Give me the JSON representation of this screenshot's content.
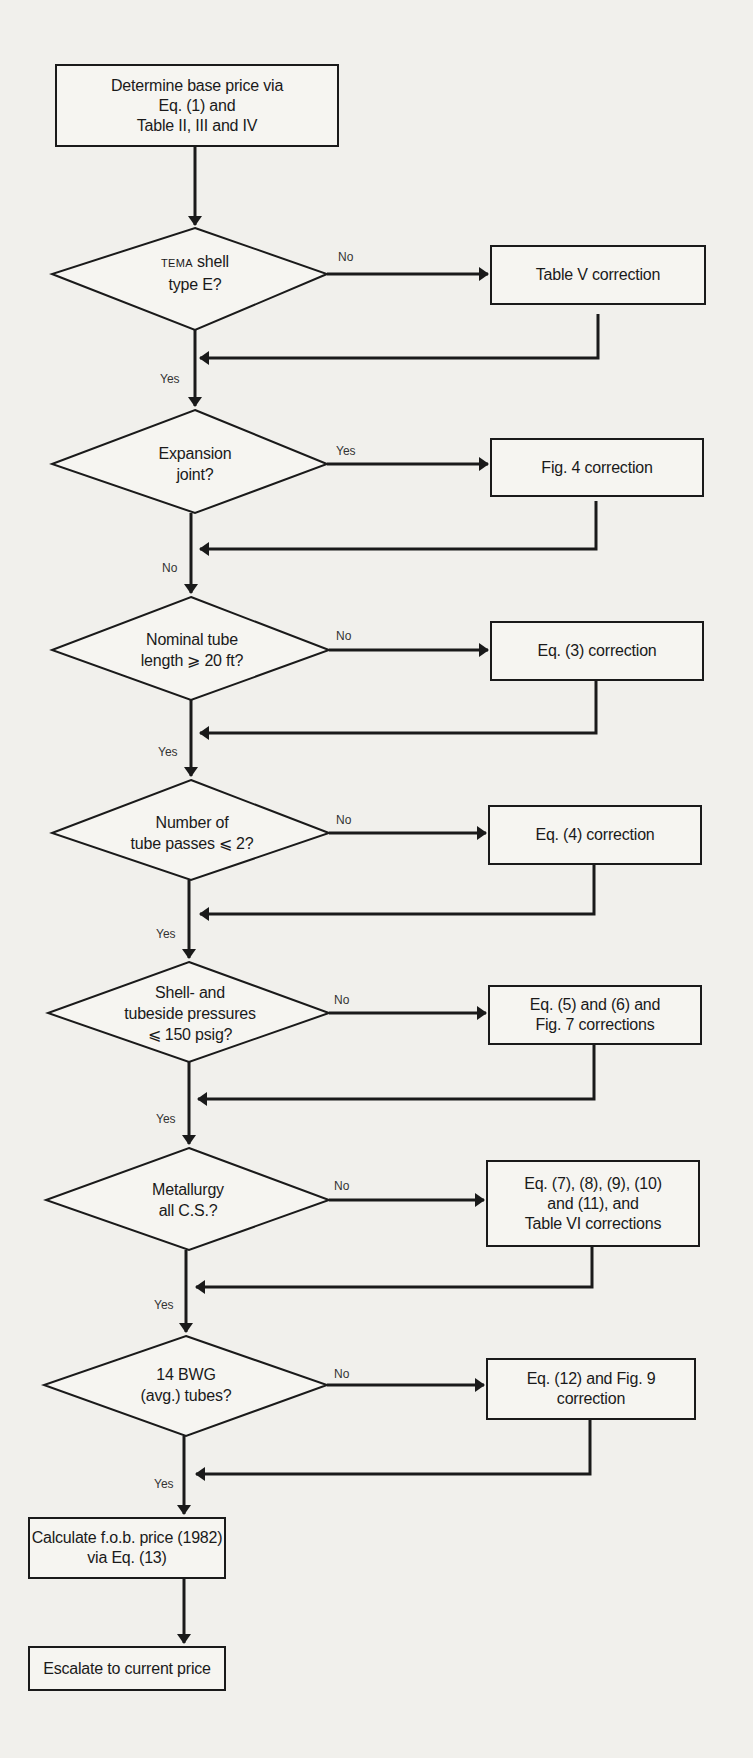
{
  "diagram": {
    "type": "flowchart",
    "start": {
      "text": "Determine base price via\nEq. (1) and\nTable II, III and IV"
    },
    "decisions": [
      {
        "prefix": "TEMA",
        "text_line1": " shell",
        "text_line2": "type E?",
        "branch_label": "No",
        "continue_label": "Yes",
        "correction": "Table V correction"
      },
      {
        "text": "Expansion\njoint?",
        "branch_label": "Yes",
        "continue_label": "No",
        "correction": "Fig. 4 correction"
      },
      {
        "text": "Nominal tube\nlength ⩾ 20 ft?",
        "branch_label": "No",
        "continue_label": "Yes",
        "correction": "Eq. (3) correction"
      },
      {
        "text": "Number of\ntube passes ⩽ 2?",
        "branch_label": "No",
        "continue_label": "Yes",
        "correction": "Eq. (4) correction"
      },
      {
        "text": "Shell- and\ntubeside pressures\n⩽ 150 psig?",
        "branch_label": "No",
        "continue_label": "Yes",
        "correction": "Eq. (5) and (6) and\nFig. 7 corrections"
      },
      {
        "text": "Metallurgy\nall C.S.?",
        "branch_label": "No",
        "continue_label": "Yes",
        "correction": "Eq. (7), (8), (9), (10)\nand (11), and\nTable VI corrections"
      },
      {
        "text": "14 BWG\n(avg.) tubes?",
        "branch_label": "No",
        "continue_label": "Yes",
        "correction": "Eq. (12) and Fig. 9\ncorrection"
      }
    ],
    "calculate": {
      "text": "Calculate f.o.b. price (1982)\nvia Eq. (13)"
    },
    "end": {
      "text": "Escalate to current price"
    }
  }
}
